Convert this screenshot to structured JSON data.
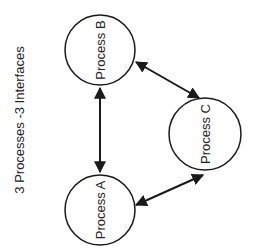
{
  "title": "3 Processes -3 Interfaces",
  "nodes": [
    {
      "id": "A",
      "label": "Process A"
    },
    {
      "id": "B",
      "label": "Process B"
    },
    {
      "id": "C",
      "label": "Process C"
    }
  ],
  "edges": [
    {
      "from": "A",
      "to": "B",
      "type": "bidirectional"
    },
    {
      "from": "B",
      "to": "C",
      "type": "bidirectional"
    },
    {
      "from": "A",
      "to": "C",
      "type": "bidirectional"
    }
  ],
  "colors": {
    "stroke": "#1a1a1a",
    "text": "#222222",
    "background": "#ffffff"
  }
}
